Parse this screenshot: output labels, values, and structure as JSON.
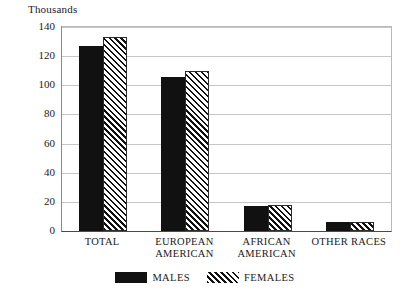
{
  "chart_data": {
    "type": "bar",
    "title": "",
    "subtitle": "",
    "unit_label": "Thousands",
    "xlabel": "",
    "ylabel": "Thousands",
    "ylim": [
      0,
      140
    ],
    "y_ticks": [
      0,
      20,
      40,
      60,
      80,
      100,
      120,
      140
    ],
    "grid": "horizontal",
    "legend_position": "bottom-center",
    "categories": [
      "TOTAL",
      "EUROPEAN\nAMERICAN",
      "AFRICAN\nAMERICAN",
      "OTHER RACES"
    ],
    "series": [
      {
        "name": "MALES",
        "fill": "solid-black",
        "color": "#111111",
        "values": [
          127,
          106,
          17,
          6
        ]
      },
      {
        "name": "FEMALES",
        "fill": "diagonal-hatch",
        "color": "#111111",
        "values": [
          133,
          110,
          18,
          6
        ]
      }
    ]
  },
  "legend": {
    "entries": [
      {
        "label": "MALES",
        "swatch": "solid-black-swatch"
      },
      {
        "label": "FEMALES",
        "swatch": "diagonal-hatch-swatch"
      }
    ]
  }
}
